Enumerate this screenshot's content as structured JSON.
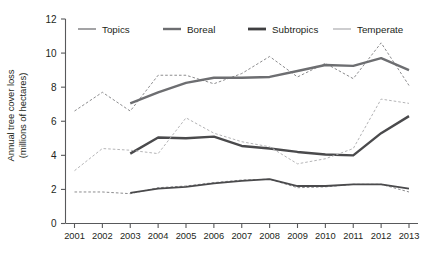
{
  "chart_data": {
    "type": "line",
    "title": "",
    "xlabel": "",
    "ylabel": "Annual tree cover loss\n(millions of hectares)",
    "ylabel_line1": "Annual tree cover loss",
    "ylabel_line2": "(millions of hectares)",
    "categories": [
      "2001",
      "2002",
      "2003",
      "2004",
      "2005",
      "2006",
      "2007",
      "2008",
      "2009",
      "2010",
      "2011",
      "2012",
      "2013"
    ],
    "x": [
      2001,
      2002,
      2003,
      2004,
      2005,
      2006,
      2007,
      2008,
      2009,
      2010,
      2011,
      2012,
      2013
    ],
    "ylim": [
      0,
      12
    ],
    "yticks": [
      0,
      2,
      4,
      6,
      8,
      10,
      12
    ],
    "ytick_labels": [
      "0",
      "2",
      "4",
      "6",
      "8",
      "10",
      "12"
    ],
    "grid": false,
    "legend_position": "top-inside",
    "series": [
      {
        "name": "Topics",
        "style": "dashed",
        "color": "#8c8c8e",
        "width": 1.0,
        "values": [
          6.6,
          7.0,
          7.7,
          6.6,
          8.7,
          8.7,
          8.2,
          8.8,
          9.3,
          9.8,
          9.3,
          8.5,
          10.6,
          9.6,
          8.1
        ],
        "x_values": [
          2001,
          2002,
          2002.5,
          2003,
          2004,
          2005,
          2005.5,
          2006,
          2007,
          2008,
          2008.5,
          2009,
          2010,
          2011,
          2012
        ],
        "points": [
          {
            "x": 2001,
            "y": 6.6
          },
          {
            "x": 2002,
            "y": 7.7
          },
          {
            "x": 2003,
            "y": 6.6
          },
          {
            "x": 2004,
            "y": 8.7
          },
          {
            "x": 2005,
            "y": 8.7
          },
          {
            "x": 2006,
            "y": 8.2
          },
          {
            "x": 2007,
            "y": 8.8
          },
          {
            "x": 2008,
            "y": 9.8
          },
          {
            "x": 2009,
            "y": 8.6
          },
          {
            "x": 2010,
            "y": 9.4
          },
          {
            "x": 2011,
            "y": 8.5
          },
          {
            "x": 2012,
            "y": 10.6
          },
          {
            "x": 2013,
            "y": 8.1
          }
        ]
      },
      {
        "name": "Boreal",
        "style": "solid",
        "color": "#6d6e71",
        "width": 2.4,
        "points": [
          {
            "x": 2003,
            "y": 7.05
          },
          {
            "x": 2004,
            "y": 7.7
          },
          {
            "x": 2005,
            "y": 8.25
          },
          {
            "x": 2006,
            "y": 8.55
          },
          {
            "x": 2007,
            "y": 8.55
          },
          {
            "x": 2008,
            "y": 8.6
          },
          {
            "x": 2009,
            "y": 8.95
          },
          {
            "x": 2010,
            "y": 9.3
          },
          {
            "x": 2011,
            "y": 9.25
          },
          {
            "x": 2012,
            "y": 9.7
          },
          {
            "x": 2013,
            "y": 9.0
          }
        ]
      },
      {
        "name": "Subtropics",
        "style": "solid",
        "color": "#4a4a4c",
        "width": 2.4,
        "points": [
          {
            "x": 2003,
            "y": 4.1
          },
          {
            "x": 2004,
            "y": 5.05
          },
          {
            "x": 2005,
            "y": 5.0
          },
          {
            "x": 2006,
            "y": 5.1
          },
          {
            "x": 2007,
            "y": 4.55
          },
          {
            "x": 2008,
            "y": 4.4
          },
          {
            "x": 2009,
            "y": 4.2
          },
          {
            "x": 2010,
            "y": 4.05
          },
          {
            "x": 2011,
            "y": 4.0
          },
          {
            "x": 2012,
            "y": 5.3
          },
          {
            "x": 2013,
            "y": 6.3
          }
        ]
      },
      {
        "name": "Temperate",
        "style": "dashed",
        "color": "#b5b5b7",
        "width": 1.0,
        "points": [
          {
            "x": 2001,
            "y": 3.1
          },
          {
            "x": 2002,
            "y": 4.4
          },
          {
            "x": 2003,
            "y": 4.3
          },
          {
            "x": 2004,
            "y": 4.1
          },
          {
            "x": 2005,
            "y": 6.2
          },
          {
            "x": 2006,
            "y": 5.3
          },
          {
            "x": 2007,
            "y": 4.8
          },
          {
            "x": 2008,
            "y": 4.5
          },
          {
            "x": 2009,
            "y": 3.5
          },
          {
            "x": 2010,
            "y": 3.8
          },
          {
            "x": 2011,
            "y": 4.4
          },
          {
            "x": 2012,
            "y": 7.3
          },
          {
            "x": 2013,
            "y": 7.05
          }
        ]
      },
      {
        "name": "Topics-lower",
        "style": "dashed",
        "color": "#8c8c8e",
        "width": 1.0,
        "points": [
          {
            "x": 2001,
            "y": 1.85
          },
          {
            "x": 2002,
            "y": 1.85
          },
          {
            "x": 2003,
            "y": 1.75
          },
          {
            "x": 2004,
            "y": 2.1
          },
          {
            "x": 2005,
            "y": 2.2
          },
          {
            "x": 2006,
            "y": 2.4
          },
          {
            "x": 2007,
            "y": 2.55
          },
          {
            "x": 2008,
            "y": 2.6
          },
          {
            "x": 2009,
            "y": 2.1
          },
          {
            "x": 2010,
            "y": 2.15
          },
          {
            "x": 2011,
            "y": 2.3
          },
          {
            "x": 2012,
            "y": 2.3
          },
          {
            "x": 2013,
            "y": 1.85
          }
        ]
      },
      {
        "name": "Subtropics-lower",
        "style": "solid",
        "color": "#4a4a4c",
        "width": 1.8,
        "points": [
          {
            "x": 2003,
            "y": 1.8
          },
          {
            "x": 2004,
            "y": 2.05
          },
          {
            "x": 2005,
            "y": 2.15
          },
          {
            "x": 2006,
            "y": 2.35
          },
          {
            "x": 2007,
            "y": 2.5
          },
          {
            "x": 2008,
            "y": 2.6
          },
          {
            "x": 2009,
            "y": 2.2
          },
          {
            "x": 2010,
            "y": 2.2
          },
          {
            "x": 2011,
            "y": 2.3
          },
          {
            "x": 2012,
            "y": 2.3
          },
          {
            "x": 2013,
            "y": 2.05
          }
        ]
      }
    ],
    "legend": [
      {
        "label": "Topics",
        "color": "#8c8c8e",
        "width": 1.6,
        "style": "solid"
      },
      {
        "label": "Boreal",
        "color": "#6d6e71",
        "width": 2.4,
        "style": "solid"
      },
      {
        "label": "Subtropics",
        "color": "#3f3f41",
        "width": 2.8,
        "style": "solid"
      },
      {
        "label": "Temperate",
        "color": "#c8c8ca",
        "width": 1.8,
        "style": "solid"
      }
    ]
  },
  "colors": {
    "axis": "#58595b",
    "text": "#231f20",
    "background": "#ffffff"
  }
}
